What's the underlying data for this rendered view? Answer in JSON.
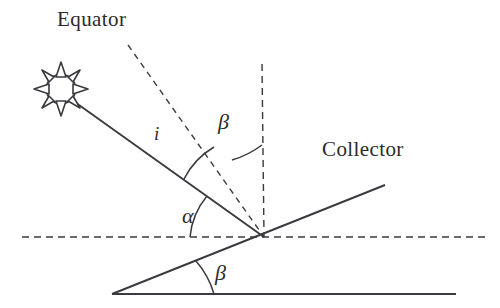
{
  "figure": {
    "title_visible": false,
    "background_color": "#ffffff",
    "stroke_color": "#3a3a40",
    "text_color": "#2b2b2b"
  },
  "labels": {
    "equator": "Equator",
    "collector": "Collector",
    "incidence_angle": "i",
    "tilt_angle_upper": "β",
    "altitude_angle": "α",
    "tilt_angle_lower": "β"
  },
  "elements": {
    "sun_icon": "sun-icon",
    "sun_ray": "sun-ray-line",
    "equator_line": "equator-dashed-line",
    "vertical_normal": "vertical-dashed-line",
    "horizontal_reference": "horizontal-dashed-line",
    "collector_surface": "collector-line",
    "ground_line": "ground-solid-line",
    "arc_i": "angle-arc-i",
    "arc_beta_upper": "angle-arc-beta-upper",
    "arc_alpha": "angle-arc-alpha",
    "arc_beta_lower": "angle-arc-beta-lower"
  },
  "geometry": {
    "vertex": {
      "x": 264,
      "y": 237
    },
    "sun_center": {
      "x": 61,
      "y": 89
    },
    "sun_radius": 14,
    "ground_apex": {
      "x": 112,
      "y": 294
    },
    "collector_end": {
      "x": 385,
      "y": 185
    },
    "equator_start": {
      "x": 128,
      "y": 45
    },
    "vertical_top": {
      "x": 262,
      "y": 64
    },
    "horizontal_left": {
      "x": 22,
      "y": 237
    },
    "horizontal_right": {
      "x": 486,
      "y": 237
    },
    "ground_right": {
      "x": 456,
      "y": 294
    }
  }
}
